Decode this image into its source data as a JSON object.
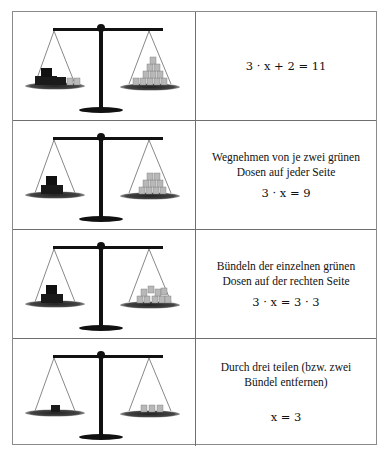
{
  "rows": [
    {
      "equation": "3 · x + 2 = 11",
      "description": "",
      "scale": {
        "left": {
          "dark_bundles": 3,
          "light_cans": 2
        },
        "right": {
          "light_cans": 11,
          "arrangement": "pyramid"
        }
      }
    },
    {
      "equation": "3 · x = 9",
      "description": "Wegnehmen von je zwei grünen Dosen auf jeder Seite",
      "scale": {
        "left": {
          "dark_bundles": 3,
          "light_cans": 0
        },
        "right": {
          "light_cans": 9,
          "arrangement": "pyramid"
        }
      }
    },
    {
      "equation": "3 · x = 3 · 3",
      "description": "Bündeln der einzelnen grünen Dosen auf der rechten Seite",
      "scale": {
        "left": {
          "dark_bundles": 3,
          "light_cans": 0
        },
        "right": {
          "light_cans": 9,
          "arrangement": "three bundles"
        }
      }
    },
    {
      "equation": "x = 3",
      "description": "Durch drei teilen (bzw. zwei Bündel entfernen)",
      "scale": {
        "left": {
          "dark_bundles": 1,
          "light_cans": 0
        },
        "right": {
          "light_cans": 3,
          "arrangement": "row"
        }
      }
    }
  ],
  "colors": {
    "border": "#6f6f6f",
    "scale": "#111111",
    "dark_can": "#1a1a1a",
    "light_can": "#b8b8b8"
  }
}
